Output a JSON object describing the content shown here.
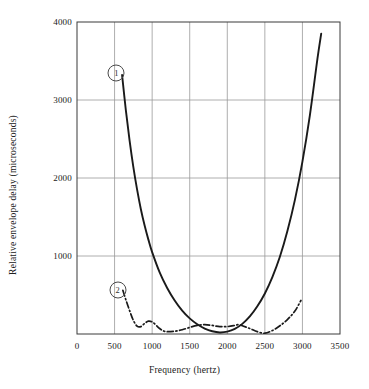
{
  "chart_data": {
    "type": "line",
    "title": "",
    "xlabel": "Frequency (hertz)",
    "ylabel": "Relative envelope delay (microseconds)",
    "xlim": [
      0,
      3500
    ],
    "ylim": [
      0,
      4000
    ],
    "xticks": [
      0,
      500,
      1000,
      1500,
      2000,
      2500,
      3000,
      3500
    ],
    "xtick_labels": [
      "0",
      "500",
      "1000",
      "1500",
      "2000",
      "2500",
      "3000",
      "3500"
    ],
    "yticks": [
      0,
      1000,
      2000,
      3000,
      4000
    ],
    "ytick_labels": [
      "0",
      "1000",
      "2000",
      "3000",
      "4000"
    ],
    "grid": true,
    "legend_position": "inline-annotations",
    "annotations": [
      {
        "label": "1",
        "x": 525,
        "y": 3345
      },
      {
        "label": "2",
        "x": 540,
        "y": 565
      }
    ],
    "series": [
      {
        "name": "1",
        "style": "solid",
        "color": "#1a1a1a",
        "points": [
          {
            "x": 600,
            "y": 3320
          },
          {
            "x": 650,
            "y": 2870
          },
          {
            "x": 700,
            "y": 2480
          },
          {
            "x": 750,
            "y": 2140
          },
          {
            "x": 800,
            "y": 1850
          },
          {
            "x": 850,
            "y": 1600
          },
          {
            "x": 900,
            "y": 1390
          },
          {
            "x": 950,
            "y": 1210
          },
          {
            "x": 1000,
            "y": 1050
          },
          {
            "x": 1100,
            "y": 790
          },
          {
            "x": 1200,
            "y": 590
          },
          {
            "x": 1300,
            "y": 430
          },
          {
            "x": 1400,
            "y": 300
          },
          {
            "x": 1500,
            "y": 200
          },
          {
            "x": 1600,
            "y": 125
          },
          {
            "x": 1700,
            "y": 70
          },
          {
            "x": 1800,
            "y": 35
          },
          {
            "x": 1900,
            "y": 20
          },
          {
            "x": 2000,
            "y": 30
          },
          {
            "x": 2100,
            "y": 65
          },
          {
            "x": 2200,
            "y": 130
          },
          {
            "x": 2300,
            "y": 225
          },
          {
            "x": 2400,
            "y": 355
          },
          {
            "x": 2500,
            "y": 520
          },
          {
            "x": 2600,
            "y": 730
          },
          {
            "x": 2700,
            "y": 990
          },
          {
            "x": 2800,
            "y": 1320
          },
          {
            "x": 2900,
            "y": 1720
          },
          {
            "x": 3000,
            "y": 2210
          },
          {
            "x": 3100,
            "y": 2810
          },
          {
            "x": 3200,
            "y": 3530
          },
          {
            "x": 3250,
            "y": 3850
          }
        ]
      },
      {
        "name": "2",
        "style": "dash-dot",
        "color": "#1a1a1a",
        "points": [
          {
            "x": 610,
            "y": 560
          },
          {
            "x": 650,
            "y": 440
          },
          {
            "x": 700,
            "y": 300
          },
          {
            "x": 750,
            "y": 175
          },
          {
            "x": 800,
            "y": 100
          },
          {
            "x": 850,
            "y": 95
          },
          {
            "x": 900,
            "y": 135
          },
          {
            "x": 950,
            "y": 165
          },
          {
            "x": 1000,
            "y": 155
          },
          {
            "x": 1050,
            "y": 115
          },
          {
            "x": 1100,
            "y": 70
          },
          {
            "x": 1150,
            "y": 40
          },
          {
            "x": 1200,
            "y": 30
          },
          {
            "x": 1300,
            "y": 35
          },
          {
            "x": 1400,
            "y": 55
          },
          {
            "x": 1500,
            "y": 85
          },
          {
            "x": 1600,
            "y": 110
          },
          {
            "x": 1700,
            "y": 120
          },
          {
            "x": 1800,
            "y": 110
          },
          {
            "x": 1900,
            "y": 95
          },
          {
            "x": 2000,
            "y": 95
          },
          {
            "x": 2100,
            "y": 110
          },
          {
            "x": 2150,
            "y": 120
          },
          {
            "x": 2200,
            "y": 105
          },
          {
            "x": 2300,
            "y": 70
          },
          {
            "x": 2400,
            "y": 30
          },
          {
            "x": 2500,
            "y": 10
          },
          {
            "x": 2600,
            "y": 45
          },
          {
            "x": 2700,
            "y": 105
          },
          {
            "x": 2800,
            "y": 185
          },
          {
            "x": 2900,
            "y": 295
          },
          {
            "x": 2980,
            "y": 430
          }
        ]
      }
    ]
  },
  "axes": {
    "frame_color": "#3a3a3a",
    "grid_color": "#999999"
  }
}
